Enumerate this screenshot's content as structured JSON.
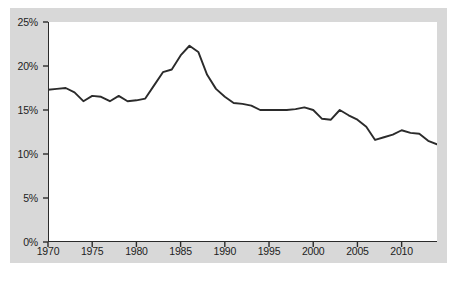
{
  "figure": {
    "background_color": "#ffffff",
    "panel_color": "#d8d8d8",
    "plot_background": "#ffffff",
    "line_color": "#2b2b2b",
    "axis_color": "#2b2b2b",
    "tick_color": "#2b2b2b",
    "caption": ""
  },
  "chart_data": {
    "type": "line",
    "title": "",
    "subtitle": "",
    "xlabel": "",
    "ylabel": "",
    "xlim": [
      1970,
      2014
    ],
    "ylim": [
      0,
      25
    ],
    "grid": false,
    "legend": null,
    "legend_position": "none",
    "annotations": [],
    "y_tick_labels": [
      "0%",
      "5%",
      "10%",
      "15%",
      "20%",
      "25%"
    ],
    "y_tick_values": [
      0,
      5,
      10,
      15,
      20,
      25
    ],
    "x_tick_labels": [
      "1970",
      "1975",
      "1980",
      "1985",
      "1990",
      "1995",
      "2000",
      "2005",
      "2010"
    ],
    "x_tick_values": [
      1970,
      1975,
      1980,
      1985,
      1990,
      1995,
      2000,
      2005,
      2010
    ],
    "x": [
      1970,
      1971,
      1972,
      1973,
      1974,
      1975,
      1976,
      1977,
      1978,
      1979,
      1980,
      1981,
      1982,
      1983,
      1984,
      1985,
      1986,
      1987,
      1988,
      1989,
      1990,
      1991,
      1992,
      1993,
      1994,
      1995,
      1996,
      1997,
      1998,
      1999,
      2000,
      2001,
      2002,
      2003,
      2004,
      2005,
      2006,
      2007,
      2008,
      2009,
      2010,
      2011,
      2012,
      2013,
      2014
    ],
    "values": [
      17.3,
      17.4,
      17.5,
      17.0,
      16.0,
      16.6,
      16.5,
      16.0,
      16.6,
      16.0,
      16.1,
      16.3,
      17.8,
      19.3,
      19.6,
      21.2,
      22.3,
      21.6,
      19.0,
      17.4,
      16.5,
      15.8,
      15.7,
      15.5,
      15.0,
      15.0,
      15.0,
      15.0,
      15.1,
      15.3,
      15.0,
      14.0,
      13.9,
      15.0,
      14.4,
      13.9,
      13.1,
      11.6,
      11.9,
      12.2,
      12.7,
      12.4,
      12.3,
      11.5,
      11.1
    ],
    "series": [
      {
        "name": "",
        "values": [
          17.3,
          17.4,
          17.5,
          17.0,
          16.0,
          16.6,
          16.5,
          16.0,
          16.6,
          16.0,
          16.1,
          16.3,
          17.8,
          19.3,
          19.6,
          21.2,
          22.3,
          21.6,
          19.0,
          17.4,
          16.5,
          15.8,
          15.7,
          15.5,
          15.0,
          15.0,
          15.0,
          15.0,
          15.1,
          15.3,
          15.0,
          14.0,
          13.9,
          15.0,
          14.4,
          13.9,
          13.1,
          11.6,
          11.9,
          12.2,
          12.7,
          12.4,
          12.3,
          11.5,
          11.1
        ]
      }
    ]
  }
}
